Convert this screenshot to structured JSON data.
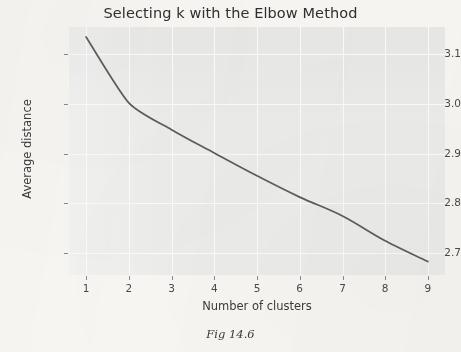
{
  "figure": {
    "title": "Selecting k with the Elbow Method",
    "caption": "Fig 14.6"
  },
  "chart_data": {
    "type": "line",
    "title": "Selecting k with the Elbow Method",
    "xlabel": "Number of clusters",
    "ylabel": "Average distance",
    "x": [
      1,
      2,
      3,
      4,
      5,
      6,
      7,
      8,
      9
    ],
    "values": [
      3.135,
      3.002,
      2.948,
      2.901,
      2.855,
      2.812,
      2.774,
      2.724,
      2.682
    ],
    "series": [
      {
        "name": "Average distance",
        "values": [
          3.135,
          3.002,
          2.948,
          2.901,
          2.855,
          2.812,
          2.774,
          2.724,
          2.682
        ]
      }
    ],
    "xlim": [
      0.6,
      9.4
    ],
    "ylim": [
      2.655,
      3.155
    ],
    "xticks": [
      "1",
      "2",
      "3",
      "4",
      "5",
      "6",
      "7",
      "8",
      "9"
    ],
    "xtick_values": [
      1,
      2,
      3,
      4,
      5,
      6,
      7,
      8,
      9
    ],
    "yticks": [
      "2.7",
      "2.8",
      "2.9",
      "3.0",
      "3.1"
    ],
    "ytick_values": [
      2.7,
      2.8,
      2.9,
      3.0,
      3.1
    ],
    "grid": true,
    "legend": false,
    "legend_position": "none",
    "line_color": "#5c5c5c",
    "panel_color": "#ececeb",
    "grid_color": "#fbfbfb",
    "page_color": "#f7f6f3"
  }
}
